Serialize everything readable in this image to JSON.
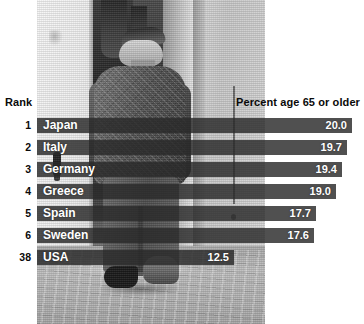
{
  "headers": {
    "rank": "Rank",
    "percent": "Percent age 65 or older"
  },
  "colors": {
    "bar": "#2a2a2a",
    "bar_text": "#ffffff",
    "header_text": "#0a0a0a",
    "background": "#ffffff"
  },
  "photo": {
    "alt_description": "Black and white photograph of an elderly man in a cap and jacket walking away down a cobblestone street past a doorway"
  },
  "chart_data": {
    "type": "bar",
    "orientation": "horizontal",
    "title": "",
    "xlabel": "Percent age 65 or older",
    "ylabel": "",
    "categories": [
      "Japan",
      "Italy",
      "Germany",
      "Greece",
      "Spain",
      "Sweden",
      "USA"
    ],
    "values": [
      20.0,
      19.7,
      19.4,
      19.0,
      17.7,
      17.6,
      12.5
    ],
    "ranks": [
      "1",
      "2",
      "3",
      "4",
      "5",
      "6",
      "38"
    ],
    "value_labels": [
      "20.0",
      "19.7",
      "19.4",
      "19.0",
      "17.7",
      "17.6",
      "12.5"
    ],
    "xlim": [
      0,
      20.4
    ],
    "grid": false,
    "legend": null
  },
  "rows": [
    {
      "rank": "1",
      "country": "Japan",
      "value": "20.0"
    },
    {
      "rank": "2",
      "country": "Italy",
      "value": "19.7"
    },
    {
      "rank": "3",
      "country": "Germany",
      "value": "19.4"
    },
    {
      "rank": "4",
      "country": "Greece",
      "value": "19.0"
    },
    {
      "rank": "5",
      "country": "Spain",
      "value": "17.7"
    },
    {
      "rank": "6",
      "country": "Sweden",
      "value": "17.6"
    },
    {
      "rank": "38",
      "country": "USA",
      "value": "12.5"
    }
  ]
}
